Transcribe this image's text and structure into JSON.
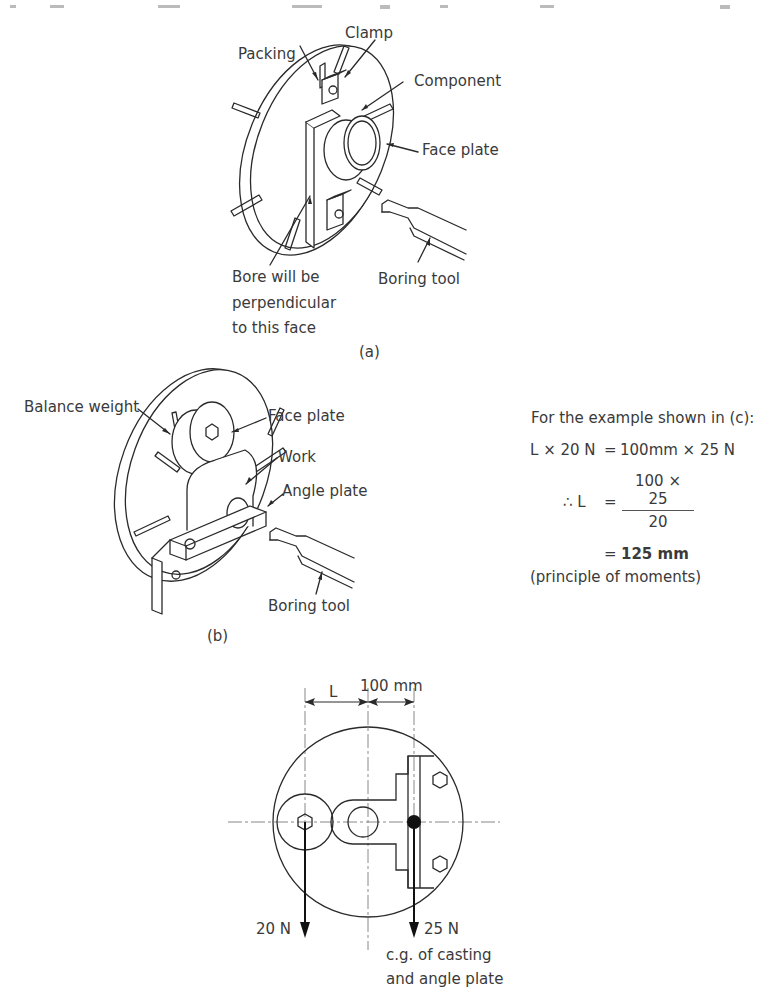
{
  "figure_a": {
    "labels": {
      "clamp": "Clamp",
      "packing": "Packing",
      "component": "Component",
      "face_plate": "Face plate",
      "bore_line1": "Bore will be",
      "bore_line2": "perpendicular",
      "bore_line3": "to this face",
      "boring_tool": "Boring tool"
    },
    "caption": "(a)"
  },
  "figure_b": {
    "labels": {
      "balance_weight": "Balance weight",
      "face_plate": "Face plate",
      "work": "Work",
      "angle_plate": "Angle plate",
      "boring_tool": "Boring tool"
    },
    "caption": "(b)"
  },
  "calculation": {
    "intro": "For the example shown in (c):",
    "line1_lhs": "L × 20 N",
    "line1_eq": "=",
    "line1_rhs": "100mm × 25 N",
    "line2_lhs": "∴ L",
    "line2_eq": "=",
    "line2_num": "100 × 25",
    "line2_den": "20",
    "line3_eq": "=",
    "line3_result": "125 mm",
    "note": "(principle of moments)"
  },
  "figure_c": {
    "dim_L": "L",
    "dim_100": "100 mm",
    "force_left": "20 N",
    "force_right": "25 N",
    "cg_line1": "c.g. of casting",
    "cg_line2": "and angle plate"
  }
}
